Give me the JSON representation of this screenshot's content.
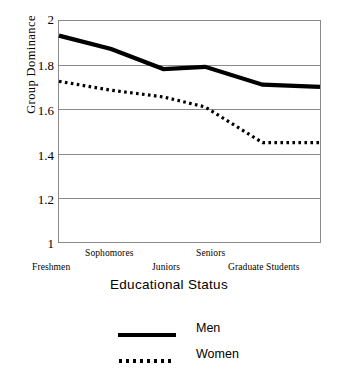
{
  "chart_data": {
    "type": "line",
    "title": "",
    "xlabel": "Educational Status",
    "ylabel": "Group Dominance",
    "categories": [
      "Freshmen",
      "Sophomores",
      "Juniors",
      "Seniors",
      "Graduate Students"
    ],
    "x_tick_labels": [
      "Freshmen",
      "Sophomores",
      "Juniors",
      "Seniors",
      "Graduate Students"
    ],
    "y_tick_labels": [
      "2",
      "1.8",
      "1.6",
      "1.4",
      "1.2",
      "1"
    ],
    "y_ticks": [
      2,
      1.8,
      1.6,
      1.4,
      1.2,
      1
    ],
    "ylim": [
      1,
      2
    ],
    "xlim": [
      0,
      5
    ],
    "grid": "horizontal",
    "legend_position": "bottom",
    "series": [
      {
        "name": "Men",
        "style": "solid",
        "color": "#000000",
        "x": [
          0.0,
          1.0,
          2.0,
          2.8,
          3.9,
          5.0
        ],
        "values": [
          1.93,
          1.87,
          1.78,
          1.79,
          1.71,
          1.7
        ]
      },
      {
        "name": "Women",
        "style": "dotted",
        "color": "#000000",
        "x": [
          0.0,
          1.0,
          2.0,
          2.8,
          3.9,
          5.0
        ],
        "values": [
          1.725,
          1.685,
          1.655,
          1.61,
          1.45,
          1.45
        ]
      }
    ]
  },
  "axes": {
    "y_title": "Group Dominance",
    "x_title": "Educational Status",
    "y_labels": [
      {
        "text": "2",
        "value": 2.0
      },
      {
        "text": "1.8",
        "value": 1.8
      },
      {
        "text": "1.6",
        "value": 1.6
      },
      {
        "text": "1.4",
        "value": 1.4
      },
      {
        "text": "1.2",
        "value": 1.2
      },
      {
        "text": "1",
        "value": 1.0
      }
    ],
    "x_labels": [
      {
        "text": "Freshmen",
        "row": "bottom"
      },
      {
        "text": "Sophomores",
        "row": "top"
      },
      {
        "text": "Juniors",
        "row": "bottom"
      },
      {
        "text": "Seniors",
        "row": "top"
      },
      {
        "text": "Graduate Students",
        "row": "bottom"
      }
    ]
  },
  "legend": {
    "entries": [
      {
        "label": "Men",
        "style": "solid"
      },
      {
        "label": "Women",
        "style": "dotted"
      }
    ]
  },
  "colors": {
    "line": "#000000",
    "grid": "#8a8a8a",
    "axis": "#8a8a8a",
    "background": "#ffffff"
  }
}
